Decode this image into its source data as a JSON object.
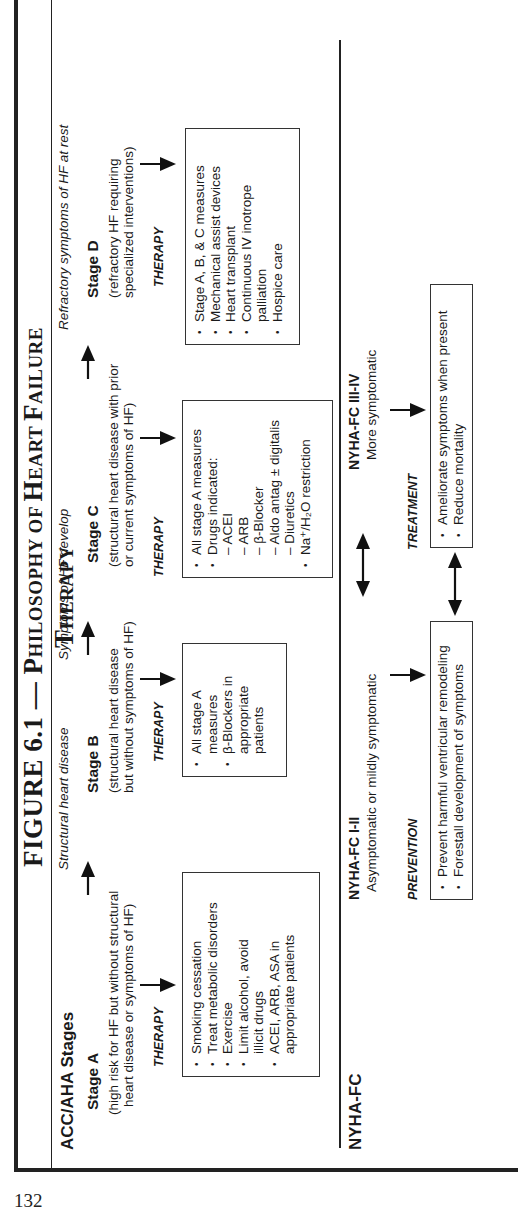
{
  "page_number": "132",
  "figure": {
    "title_prefix": "FIGURE 6.1 — P",
    "title_rest_1": "HILOSOPHY OF ",
    "title_H": "H",
    "title_rest_2": "EART ",
    "title_F": "F",
    "title_rest_3": "AILURE ",
    "title_T": "T",
    "title_rest_4": "HERAPY",
    "title_full": "FIGURE 6.1 — Philosophy of Heart Failure Therapy"
  },
  "acc_aha": {
    "heading": "ACC/AHA Stages",
    "transitions": [
      "Structural heart disease",
      "Symptoms of HF develop",
      "Refractory symptoms of HF at rest"
    ],
    "therapy_label": "THERAPY",
    "stages": [
      {
        "name": "Stage A",
        "desc_line1": "(high risk for HF but without structural",
        "desc_line2": "heart disease or symptoms of HF)",
        "therapy": [
          {
            "type": "bullet",
            "text": "Smoking cessation"
          },
          {
            "type": "bullet",
            "text": "Treat metabolic disorders"
          },
          {
            "type": "bullet",
            "text": "Exercise"
          },
          {
            "type": "bullet",
            "text": "Limit alcohol, avoid"
          },
          {
            "type": "cont",
            "text": "illicit drugs"
          },
          {
            "type": "bullet",
            "text": "ACEI, ARB, ASA in"
          },
          {
            "type": "cont",
            "text": "appropriate patients"
          }
        ]
      },
      {
        "name": "Stage B",
        "desc_line1": "(structural heart disease",
        "desc_line2": "but without symptoms of HF)",
        "therapy": [
          {
            "type": "bullet",
            "text": "All stage A"
          },
          {
            "type": "cont",
            "text": "measures"
          },
          {
            "type": "bullet",
            "text": "β-Blockers in"
          },
          {
            "type": "cont",
            "text": "appropriate"
          },
          {
            "type": "cont",
            "text": "patients"
          }
        ]
      },
      {
        "name": "Stage C",
        "desc_line1": "(structural heart disease with prior",
        "desc_line2": "or current symptoms of HF)",
        "therapy": [
          {
            "type": "bullet",
            "text": "All stage A measures"
          },
          {
            "type": "bullet",
            "text": "Drugs indicated:"
          },
          {
            "type": "dash",
            "text": "– ACEI"
          },
          {
            "type": "dash",
            "text": "– ARB"
          },
          {
            "type": "dash",
            "text": "– β-Blocker"
          },
          {
            "type": "dash",
            "text": "– Aldo antag ± digitalis"
          },
          {
            "type": "dash",
            "text": "– Diuretics"
          },
          {
            "type": "bullet",
            "text": "Na⁺/H₂O restriction"
          }
        ]
      },
      {
        "name": "Stage D",
        "desc_line1": "(refractory HF requiring",
        "desc_line2": "specialized interventions)",
        "therapy": [
          {
            "type": "bullet",
            "text": "Stage A, B, & C measures"
          },
          {
            "type": "bullet",
            "text": "Mechanical assist devices"
          },
          {
            "type": "bullet",
            "text": "Heart transplant"
          },
          {
            "type": "bullet",
            "text": "Continuous IV inotrope"
          },
          {
            "type": "cont",
            "text": "palliation"
          },
          {
            "type": "bullet",
            "text": "Hospice care"
          }
        ]
      }
    ]
  },
  "nyha": {
    "heading": "NYHA-FC",
    "classes": [
      {
        "name": "NYHA-FC I-II",
        "desc": "Asymptomatic or mildly symptomatic",
        "approach": "PREVENTION",
        "goals": [
          "Prevent harmful ventricular remodeling",
          "Forestall development of symptoms"
        ]
      },
      {
        "name": "NYHA-FC III-IV",
        "desc": "More symptomatic",
        "approach": "TREATMENT",
        "goals": [
          "Ameliorate symptoms when present",
          "Reduce mortality"
        ]
      }
    ]
  }
}
